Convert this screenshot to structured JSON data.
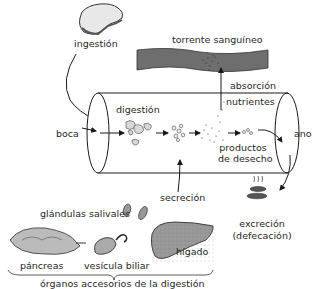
{
  "diagram": {
    "type": "process-flow",
    "topic": "digestive process",
    "labels": {
      "ingestion": "ingestión",
      "bloodstream": "torrente sanguíneo",
      "absorption": "absorción",
      "nutrients": "nutrientes",
      "digestion": "digestión",
      "mouth": "boca",
      "anus": "ano",
      "waste_products_line1": "productos",
      "waste_products_line2": "de desecho",
      "secretion": "secreción",
      "salivary_glands": "glándulas salivales",
      "excretion": "excreción",
      "defecation": "(defecación)",
      "pancreas": "páncreas",
      "gallbladder": "vesícula biliar",
      "liver": "hígado",
      "accessory_organs": "órganos accesorios de la digestión"
    },
    "flow": [
      {
        "from": "ingestión",
        "to": "boca"
      },
      {
        "from": "boca",
        "to": "digestión"
      },
      {
        "from": "digestión",
        "to": "nutrientes"
      },
      {
        "from": "nutrientes",
        "to": "torrente sanguíneo",
        "via": "absorción"
      },
      {
        "from": "productos de desecho",
        "to": "ano"
      },
      {
        "from": "ano",
        "to": "excreción (defecación)"
      },
      {
        "from": "órganos accesorios de la digestión",
        "to": "digestión",
        "via": "secreción"
      }
    ],
    "colors": {
      "bloodstream": "#6e6e6e",
      "organ_fill": "#9a9a9a",
      "line": "#1a1a1a"
    }
  }
}
